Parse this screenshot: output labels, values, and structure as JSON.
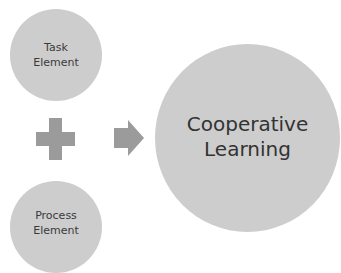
{
  "diagram": {
    "inputs": [
      {
        "id": "task",
        "lines": [
          "Task",
          "Element"
        ]
      },
      {
        "id": "process",
        "lines": [
          "Process",
          "Element"
        ]
      }
    ],
    "operator_icon": "plus-icon",
    "result_icon": "arrow-right-icon",
    "result": {
      "lines": [
        "Cooperative",
        "Learning"
      ]
    },
    "colors": {
      "circle_fill": "#cdcdcd",
      "icon_fill": "#9b9b9b",
      "text": "#333333",
      "background": "#ffffff"
    }
  }
}
